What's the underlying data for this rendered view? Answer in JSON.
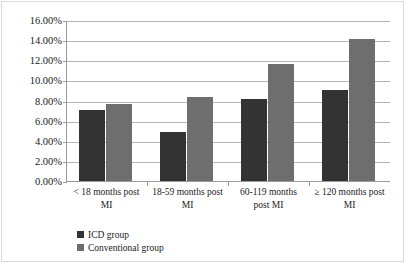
{
  "chart_data": {
    "type": "bar",
    "title": "",
    "xlabel": "",
    "ylabel": "",
    "ylim": [
      0,
      16
    ],
    "ytick_step": 2,
    "grid": true,
    "legend_position": "bottom-left",
    "y_unit": "%",
    "categories": [
      "< 18 months post MI",
      "18-59 months post MI",
      "60-119 months post MI",
      "≥ 120 months post MI"
    ],
    "category_lines": [
      [
        "< 18 months post",
        "MI"
      ],
      [
        "18-59 months post",
        "MI"
      ],
      [
        "60-119 months",
        "post MI"
      ],
      [
        "≥ 120 months post",
        "MI"
      ]
    ],
    "y_tick_labels": [
      "16.00%",
      "14.00%",
      "12.00%",
      "10.00%",
      "8.00%",
      "6.00%",
      "4.00%",
      "2.00%",
      "0.00%"
    ],
    "y_tick_values": [
      16,
      14,
      12,
      10,
      8,
      6,
      4,
      2,
      0
    ],
    "series": [
      {
        "name": "ICD group",
        "color": "#333333",
        "values": [
          7.1,
          4.9,
          8.2,
          9.0
        ]
      },
      {
        "name": "Conventional group",
        "color": "#6e6e6e",
        "values": [
          7.7,
          8.3,
          11.6,
          14.1
        ]
      }
    ]
  },
  "legend": {
    "items": [
      {
        "label": "ICD group",
        "color": "#333333"
      },
      {
        "label": "Conventional group",
        "color": "#6e6e6e"
      }
    ]
  },
  "colors": {
    "icd": "#333333",
    "conventional": "#6e6e6e",
    "gridline": "#b5b5b5",
    "axis": "#9a9a9a",
    "background": "#ffffff",
    "text": "#1a1a1a"
  }
}
